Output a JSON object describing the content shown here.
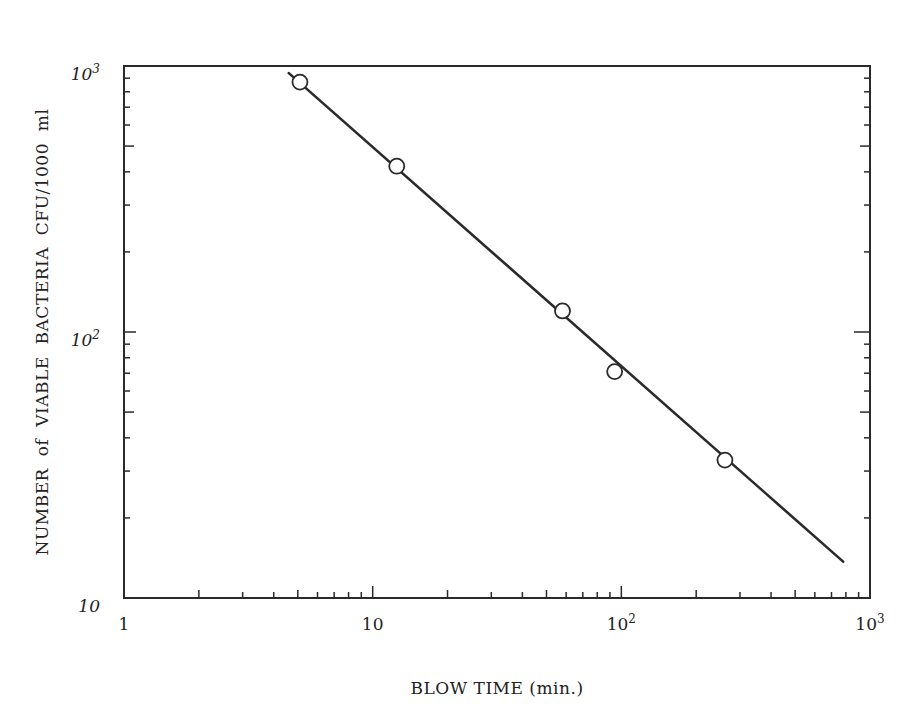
{
  "chart_data": {
    "type": "scatter",
    "title": "",
    "xlabel": "BLOW TIME (min.)",
    "ylabel": "NUMBER of VIABLE BACTERIA CFU/1000 ml",
    "xscale": "log",
    "yscale": "log",
    "xlim": [
      1,
      1000
    ],
    "ylim": [
      10,
      1000
    ],
    "grid": false,
    "legend": null,
    "x_ticks": [
      {
        "value": 1,
        "base": "1",
        "exp": ""
      },
      {
        "value": 10,
        "base": "10",
        "exp": ""
      },
      {
        "value": 100,
        "base": "10",
        "exp": "2"
      },
      {
        "value": 1000,
        "base": "10",
        "exp": "3"
      }
    ],
    "y_ticks": [
      {
        "value": 10,
        "base": "10",
        "exp": ""
      },
      {
        "value": 100,
        "base": "10",
        "exp": "2"
      },
      {
        "value": 1000,
        "base": "10",
        "exp": "3"
      }
    ],
    "series": [
      {
        "name": "measured",
        "marker": "open-circle",
        "x": [
          5.1,
          12.5,
          58,
          94,
          261
        ],
        "y": [
          870,
          420,
          120,
          71,
          33
        ]
      },
      {
        "name": "fit",
        "style": "line",
        "x": [
          4.6,
          780
        ],
        "y": [
          940,
          13.7
        ]
      }
    ]
  },
  "colors": {
    "ink": "#2a2a2a",
    "background": "#ffffff"
  }
}
